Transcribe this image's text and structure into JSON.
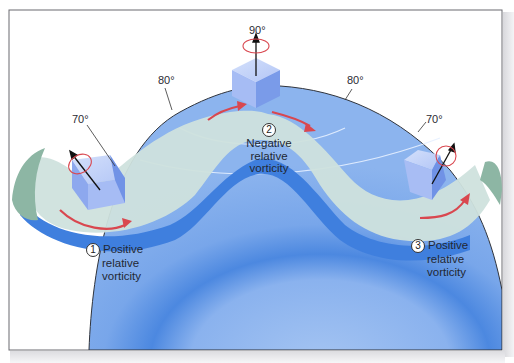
{
  "figure": {
    "colors": {
      "earth_light": "#8fb6ee",
      "earth_mid": "#6a9ce6",
      "earth_dark": "#3f7fde",
      "flow_band": "#cde0dc",
      "flow_shadow": "#3f7fde",
      "band_end_green": "#8fb7a6",
      "arrow_red": "#d9474f",
      "cube_face": "#a9bff5",
      "frame": "#6a6a70"
    },
    "latitude_labels": [
      {
        "id": "lat-70-left",
        "text": "70°"
      },
      {
        "id": "lat-80-left",
        "text": "80°"
      },
      {
        "id": "lat-90-top",
        "text": "90°"
      },
      {
        "id": "lat-80-right",
        "text": "80°"
      },
      {
        "id": "lat-70-right",
        "text": "70°"
      }
    ],
    "parcels": [
      {
        "number": "1",
        "line1": "Positive",
        "line2": "relative",
        "line3": "vorticity",
        "latitude": "70°"
      },
      {
        "number": "2",
        "line1": "Negative",
        "line2": "relative",
        "line3": "vorticity",
        "latitude": "90°"
      },
      {
        "number": "3",
        "line1": "Positive",
        "line2": "relative",
        "line3": "vorticity",
        "latitude": "70°"
      }
    ]
  }
}
